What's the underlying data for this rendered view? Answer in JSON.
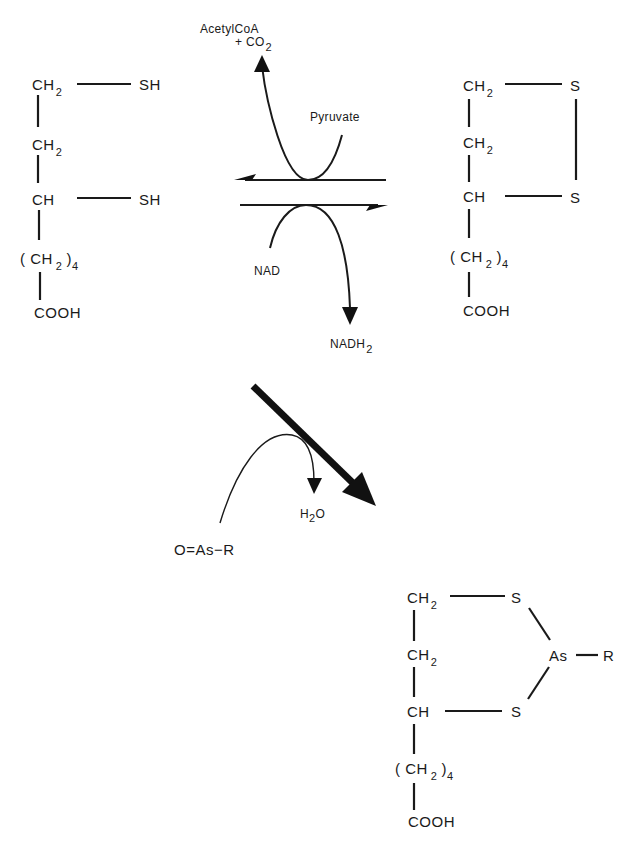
{
  "figure": {
    "type": "reaction-scheme",
    "molecules": {
      "dihydrolipoic_acid": {
        "name": "reduced lipoic acid (dithiol)",
        "atoms": {
          "c1": "CH",
          "c1_sub": "2",
          "c2": "CH",
          "c2_sub": "2",
          "c3": "CH",
          "chain_open": "( CH",
          "chain_sub": "2",
          "chain_close": ")",
          "chain_count": "4",
          "acid": "COOH",
          "s1": "SH",
          "s2": "SH"
        }
      },
      "lipoic_acid": {
        "name": "oxidized lipoic acid (disulfide)",
        "atoms": {
          "c1": "CH",
          "c1_sub": "2",
          "c2": "CH",
          "c2_sub": "2",
          "c3": "CH",
          "chain_open": "( CH",
          "chain_sub": "2",
          "chain_close": ")",
          "chain_count": "4",
          "acid": "COOH",
          "s1": "S",
          "s2": "S"
        }
      },
      "arsenite_complex": {
        "name": "lipoic acid–arsenite adduct",
        "atoms": {
          "c1": "CH",
          "c1_sub": "2",
          "c2": "CH",
          "c2_sub": "2",
          "c3": "CH",
          "chain_open": "( CH",
          "chain_sub": "2",
          "chain_close": ")",
          "chain_count": "4",
          "acid": "COOH",
          "s1": "S",
          "s2": "S",
          "as": "As",
          "r": "R"
        }
      }
    },
    "reagents": {
      "acetylcoa": "AcetylCoA",
      "co2_prefix": "+ CO",
      "co2_sub": "2",
      "pyruvate": "Pyruvate",
      "nad": "NAD",
      "nadh_prefix": "NADH",
      "nadh_sub": "2",
      "arsenical": "O=As−R",
      "water_h": "H",
      "water_sub": "2",
      "water_o": "O"
    },
    "arrows": [
      {
        "from": "dihydrolipoic_acid",
        "to": "lipoic_acid",
        "kind": "equilibrium-forward",
        "coupled": "NAD → NADH2"
      },
      {
        "from": "lipoic_acid",
        "to": "dihydrolipoic_acid",
        "kind": "equilibrium-reverse",
        "coupled": "Pyruvate → AcetylCoA + CO2"
      },
      {
        "from": "dihydrolipoic_acid",
        "to": "arsenite_complex",
        "kind": "heavy-diagonal",
        "coupled": "O=As−R → H2O"
      }
    ],
    "caption": {
      "visible": "cut-off",
      "text": ""
    },
    "colors": {
      "ink": "#1a1a1a",
      "background": "#ffffff"
    }
  }
}
